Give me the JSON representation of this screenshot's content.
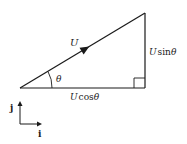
{
  "diagram": {
    "type": "vector-components-triangle",
    "vector_label": "U",
    "angle_label": "θ",
    "horizontal_component": {
      "symbol": "U",
      "func": "cos",
      "angle": "θ"
    },
    "vertical_component": {
      "symbol": "U",
      "func": "sin",
      "angle": "θ"
    },
    "axes": {
      "x_unit": "i",
      "y_unit": "j"
    },
    "colors": {
      "stroke": "#1a1a1a",
      "background": "#ffffff"
    }
  }
}
